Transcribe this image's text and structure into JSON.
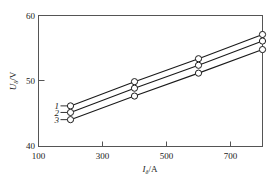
{
  "chart_data": {
    "type": "line",
    "title": "",
    "xlabel": "I",
    "xlabel_sub": "δ",
    "xlabel_unit": "/A",
    "ylabel": "U",
    "ylabel_sub": "δ",
    "ylabel_unit": "/V",
    "xlim": [
      100,
      800
    ],
    "ylim": [
      40,
      60
    ],
    "xticks": [
      100,
      300,
      500,
      700
    ],
    "yticks": [
      40,
      50,
      60
    ],
    "xtick_labels": [
      "100",
      "300",
      "500",
      "700"
    ],
    "ytick_labels": [
      "40",
      "50",
      "60"
    ],
    "grid": false,
    "legend_position": "inline-left",
    "x": [
      200,
      400,
      600,
      800
    ],
    "series": [
      {
        "name": "1",
        "label": "1",
        "values": [
          46.2,
          49.9,
          53.4,
          57.1
        ]
      },
      {
        "name": "2",
        "label": "2",
        "values": [
          45.2,
          48.9,
          52.4,
          56.1
        ]
      },
      {
        "name": "3",
        "label": "3",
        "values": [
          44.1,
          47.7,
          51.2,
          54.8
        ]
      }
    ]
  },
  "axes": {
    "y_top_label": "60",
    "y_mid_label": "50",
    "y_bottom_label": "40",
    "x_labels": [
      "100",
      "300",
      "500",
      "700"
    ]
  },
  "colors": {
    "line": "#1a1a1a",
    "frame": "#555555",
    "marker_fill": "#ffffff",
    "background": "#ffffff"
  }
}
